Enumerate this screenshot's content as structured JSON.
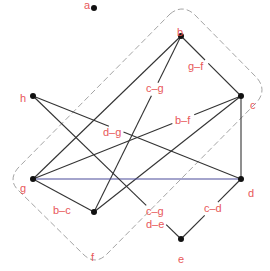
{
  "diagram": {
    "type": "graph",
    "colors": {
      "node": "#111111",
      "edge": "#333333",
      "edge_highlight": "#4a4a9a",
      "label": "#e8585a",
      "outline": "#9a9a9a"
    },
    "nodes": [
      {
        "id": "a",
        "label": "a",
        "x": 94,
        "y": 8,
        "lx": 84,
        "ly": 0
      },
      {
        "id": "b",
        "label": "b",
        "x": 181,
        "y": 36,
        "lx": 177,
        "ly": 27
      },
      {
        "id": "c",
        "label": "c",
        "x": 241,
        "y": 96,
        "lx": 250,
        "ly": 100
      },
      {
        "id": "d",
        "label": "d",
        "x": 241,
        "y": 179,
        "lx": 248,
        "ly": 188
      },
      {
        "id": "e",
        "label": "e",
        "x": 181,
        "y": 239,
        "lx": 178,
        "ly": 254
      },
      {
        "id": "f",
        "label": "f",
        "x": 94,
        "y": 212,
        "lx": 91,
        "ly": 252
      },
      {
        "id": "g",
        "label": "g",
        "x": 33,
        "y": 179,
        "lx": 20,
        "ly": 183
      },
      {
        "id": "h",
        "label": "h",
        "x": 33,
        "y": 96,
        "lx": 20,
        "ly": 93
      }
    ],
    "edges": [
      {
        "from": "b",
        "to": "g",
        "label": ""
      },
      {
        "from": "b",
        "to": "f",
        "label": "c–g",
        "lx": 146,
        "ly": 90
      },
      {
        "from": "b",
        "to": "c",
        "label": "g–f",
        "lx": 200,
        "ly": 71
      },
      {
        "from": "c",
        "to": "g",
        "label": "b–f",
        "lx": 174,
        "ly": 124
      },
      {
        "from": "c",
        "to": "f",
        "label": ""
      },
      {
        "from": "c",
        "to": "d",
        "label": ""
      },
      {
        "from": "d",
        "to": "g",
        "label": "",
        "highlight": true
      },
      {
        "from": "d",
        "to": "e",
        "label": "c–d",
        "lx": 203,
        "ly": 213
      },
      {
        "from": "g",
        "to": "f",
        "label": "b–c",
        "lx": 52,
        "ly": 214
      },
      {
        "from": "h",
        "to": "d",
        "label": "d–g",
        "lx": 102,
        "ly": 134
      },
      {
        "from": "h",
        "to": "e",
        "label": "c–g / d–e",
        "lx": 145,
        "ly": 212
      }
    ],
    "edge_labels": [
      {
        "text": "g–f",
        "x": 188,
        "y": 70
      },
      {
        "text": "c–g",
        "x": 146,
        "y": 92
      },
      {
        "text": "b–f",
        "x": 175,
        "y": 124
      },
      {
        "text": "d–g",
        "x": 103,
        "y": 136
      },
      {
        "text": "b–c",
        "x": 53,
        "y": 214
      },
      {
        "text": "c–g",
        "x": 146,
        "y": 215
      },
      {
        "text": "d–e",
        "x": 146,
        "y": 228
      },
      {
        "text": "c–d",
        "x": 204,
        "y": 212
      }
    ],
    "outline": {
      "shape": "rotated-rounded-rectangle",
      "style": "dashed",
      "corners": [
        [
          182,
          8
        ],
        [
          263,
          90
        ],
        [
          95,
          264
        ],
        [
          12,
          180
        ]
      ]
    }
  }
}
